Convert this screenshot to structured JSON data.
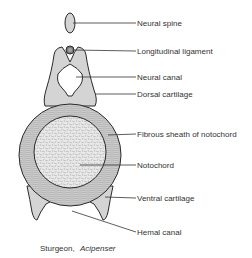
{
  "diagram": {
    "labels": {
      "neural_spine": "Neural spine",
      "longitudinal_ligament": "Longitudinal ligament",
      "neural_canal": "Neural canal",
      "dorsal_cartilage": "Dorsal cartilage",
      "fibrous_sheath": "Fibrous sheath of notochord",
      "notochord": "Notochord",
      "ventral_cartilage": "Ventral cartilage",
      "hemal_canal": "Hemal canal"
    },
    "caption": {
      "common_name": "Sturgeon,",
      "genus": "Acipenser"
    },
    "colors": {
      "cartilage_fill": "#d4d4d4",
      "outline": "#2a2a2a",
      "sheath_fill": "#c9c9c9",
      "notochord_fill": "#e6e6e6",
      "text": "#333333"
    }
  }
}
